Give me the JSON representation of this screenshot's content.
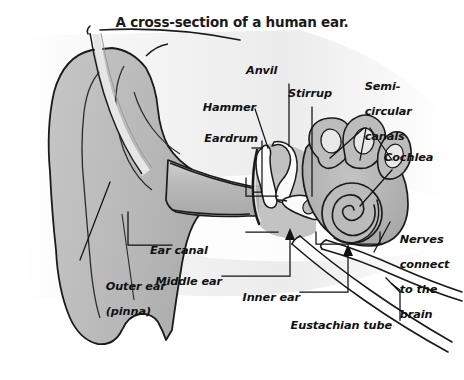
{
  "figure": {
    "title": "A cross-section of a human ear.",
    "type": "anatomical-cross-section",
    "subject": "human ear",
    "style": "grayscale line drawing",
    "background_color": "#ffffff",
    "outline_color": "#111111",
    "tissue_fill_color": "#b9b9b9",
    "bone_fill_color": "#fafafa",
    "head_shadow_color": "#d8d8d8"
  },
  "labels": {
    "eardrum": "Eardrum",
    "hammer": "Hammer",
    "anvil": "Anvil",
    "stirrup": "Stirrup",
    "semicircular_canals_line1": "Semi-",
    "semicircular_canals_line2": "circular",
    "semicircular_canals_line3": "canals",
    "cochlea": "Cochlea",
    "nerves_line1": "Nerves",
    "nerves_line2": "connect",
    "nerves_line3": "to the",
    "nerves_line4": "brain",
    "ear_canal": "Ear canal",
    "outer_ear_line1": "Outer ear",
    "outer_ear_line2": "(pinna)",
    "middle_ear": "Middle ear",
    "inner_ear": "Inner ear",
    "eustachian_tube": "Eustachian tube"
  },
  "parts": [
    {
      "name": "outer-ear-pinna",
      "region": "outer"
    },
    {
      "name": "ear-canal",
      "region": "outer"
    },
    {
      "name": "eardrum",
      "region": "middle"
    },
    {
      "name": "hammer-malleus",
      "region": "middle"
    },
    {
      "name": "anvil-incus",
      "region": "middle"
    },
    {
      "name": "stirrup-stapes",
      "region": "middle"
    },
    {
      "name": "semicircular-canals",
      "region": "inner"
    },
    {
      "name": "cochlea",
      "region": "inner"
    },
    {
      "name": "auditory-nerve",
      "region": "inner"
    },
    {
      "name": "eustachian-tube",
      "region": "middle"
    }
  ]
}
